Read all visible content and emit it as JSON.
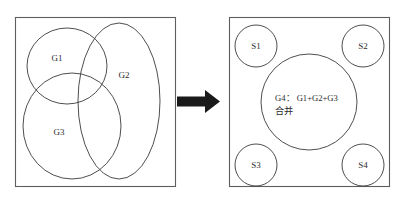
{
  "diagram": {
    "type": "before-after-merge-diagram",
    "background_color": "#ffffff",
    "stroke_color": "#3a3a3a",
    "frame_color": "#5e5e5e",
    "arrow_color": "#1a1a1a",
    "left_panel": {
      "name": "before-state",
      "groups": [
        {
          "id": "g1",
          "label": "G1"
        },
        {
          "id": "g2",
          "label": "G2"
        },
        {
          "id": "g3",
          "label": "G3"
        }
      ]
    },
    "arrow": {
      "name": "transform-arrow",
      "direction": "right",
      "glyph": "➡"
    },
    "right_panel": {
      "name": "after-state",
      "merged_group": {
        "id": "g4",
        "label_line1": "G4： G1+G2+G3",
        "label_line2": "合并"
      },
      "satellites": [
        {
          "id": "s1",
          "label": "S1"
        },
        {
          "id": "s2",
          "label": "S2"
        },
        {
          "id": "s3",
          "label": "S3"
        },
        {
          "id": "s4",
          "label": "S4"
        }
      ]
    }
  }
}
